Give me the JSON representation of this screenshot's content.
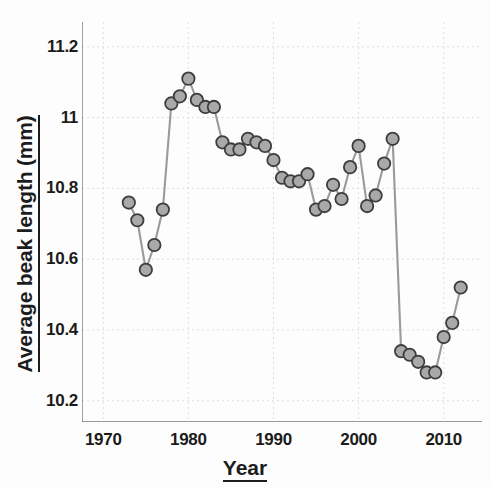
{
  "chart_data": {
    "type": "line",
    "title": "",
    "subtitle": "",
    "xlabel": "Year",
    "ylabel": "Average beak length (mm)",
    "xlim": [
      1967.5,
      2014.5
    ],
    "ylim": [
      10.14,
      11.27
    ],
    "xticks": [
      1970,
      1980,
      1990,
      2000,
      2010
    ],
    "yticks": [
      10.2,
      10.4,
      10.6,
      10.8,
      11,
      11.2
    ],
    "ytick_labels": [
      "10.2",
      "10.4",
      "10.6",
      "10.8",
      "11",
      "11.2"
    ],
    "xtick_labels": [
      "1970",
      "1980",
      "1990",
      "2000",
      "2010"
    ],
    "grid": true,
    "legend": null,
    "marker": "circle",
    "marker_color": "#a9a9a9",
    "marker_edge_color": "#3d3d3d",
    "line_color": "#9a9a9a",
    "series": [
      {
        "name": "Average beak length",
        "x": [
          1973,
          1974,
          1975,
          1976,
          1977,
          1978,
          1979,
          1980,
          1981,
          1982,
          1983,
          1984,
          1985,
          1986,
          1987,
          1988,
          1989,
          1990,
          1991,
          1992,
          1993,
          1994,
          1995,
          1996,
          1997,
          1998,
          1999,
          2000,
          2001,
          2002,
          2003,
          2004,
          2005,
          2006,
          2007,
          2008,
          2009,
          2010,
          2011,
          2012
        ],
        "y": [
          10.76,
          10.71,
          10.57,
          10.64,
          10.74,
          11.04,
          11.06,
          11.11,
          11.05,
          11.03,
          11.03,
          10.93,
          10.91,
          10.91,
          10.94,
          10.93,
          10.92,
          10.88,
          10.83,
          10.82,
          10.82,
          10.84,
          10.74,
          10.75,
          10.81,
          10.77,
          10.86,
          10.92,
          10.75,
          10.78,
          10.87,
          10.94,
          10.34,
          10.33,
          10.31,
          10.28,
          10.28,
          10.38,
          10.42,
          10.52
        ]
      }
    ]
  },
  "axes": {
    "y_title": "Average beak length (mm)",
    "x_title": "Year"
  }
}
